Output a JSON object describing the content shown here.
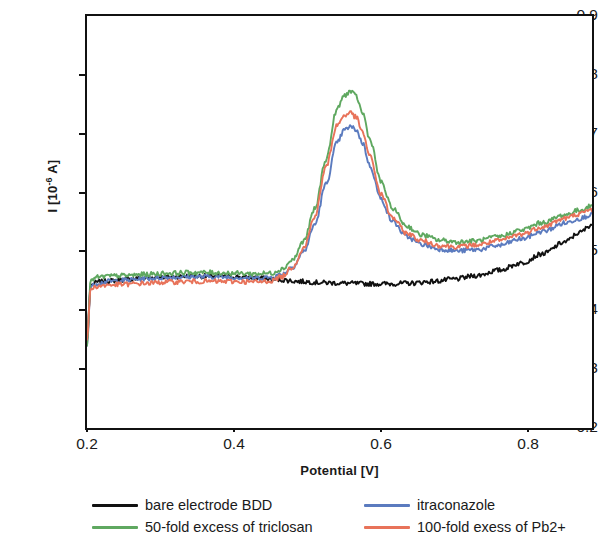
{
  "chart_data": {
    "type": "line",
    "title": "",
    "xlabel": "Potential [V]",
    "ylabel": "I [10-6 A]",
    "ylabel_prefix": "I [10",
    "ylabel_exponent": "-6",
    "ylabel_suffix": " A]",
    "xlim": [
      0.2,
      0.887
    ],
    "ylim": [
      0.2,
      0.9
    ],
    "xticks": [
      0.2,
      0.4,
      0.6,
      0.8
    ],
    "xtick_labels": [
      "0.2",
      "0.4",
      "0.6",
      "0.8"
    ],
    "yticks": [
      0.2,
      0.3,
      0.4,
      0.5,
      0.6,
      0.7,
      0.8,
      0.9
    ],
    "ytick_labels": [
      "0.2",
      "0.3",
      "0.4",
      "0.5",
      "0.6",
      "0.7",
      "0.8",
      "0.9"
    ],
    "grid": false,
    "legend_position": "below-plot",
    "noise_amplitude": 0.004,
    "series": [
      {
        "name": "bare electrode BDD",
        "color": "#111111",
        "x": [
          0.2,
          0.205,
          0.215,
          0.23,
          0.25,
          0.28,
          0.31,
          0.34,
          0.37,
          0.4,
          0.43,
          0.46,
          0.49,
          0.52,
          0.55,
          0.58,
          0.61,
          0.64,
          0.67,
          0.7,
          0.73,
          0.76,
          0.79,
          0.82,
          0.85,
          0.87,
          0.887
        ],
        "y": [
          0.35,
          0.443,
          0.448,
          0.45,
          0.452,
          0.455,
          0.457,
          0.458,
          0.458,
          0.457,
          0.455,
          0.452,
          0.449,
          0.447,
          0.446,
          0.445,
          0.445,
          0.446,
          0.449,
          0.453,
          0.459,
          0.468,
          0.48,
          0.496,
          0.516,
          0.532,
          0.546
        ]
      },
      {
        "name": "itraconazole",
        "color": "#5B7BBF",
        "x": [
          0.2,
          0.205,
          0.215,
          0.23,
          0.25,
          0.28,
          0.31,
          0.34,
          0.37,
          0.4,
          0.43,
          0.45,
          0.465,
          0.48,
          0.495,
          0.51,
          0.525,
          0.54,
          0.55,
          0.558,
          0.566,
          0.575,
          0.585,
          0.6,
          0.615,
          0.635,
          0.655,
          0.68,
          0.705,
          0.73,
          0.76,
          0.79,
          0.82,
          0.85,
          0.87,
          0.887
        ],
        "y": [
          0.34,
          0.44,
          0.446,
          0.449,
          0.451,
          0.454,
          0.456,
          0.457,
          0.457,
          0.456,
          0.455,
          0.456,
          0.461,
          0.474,
          0.5,
          0.546,
          0.614,
          0.684,
          0.706,
          0.712,
          0.707,
          0.684,
          0.645,
          0.589,
          0.552,
          0.525,
          0.512,
          0.504,
          0.501,
          0.503,
          0.51,
          0.521,
          0.534,
          0.548,
          0.556,
          0.563
        ]
      },
      {
        "name": "50-fold excess of triclosan",
        "color": "#5FA860",
        "x": [
          0.2,
          0.205,
          0.215,
          0.23,
          0.25,
          0.28,
          0.31,
          0.34,
          0.37,
          0.4,
          0.43,
          0.45,
          0.465,
          0.48,
          0.495,
          0.51,
          0.525,
          0.54,
          0.55,
          0.558,
          0.566,
          0.575,
          0.585,
          0.6,
          0.615,
          0.635,
          0.655,
          0.68,
          0.705,
          0.73,
          0.76,
          0.79,
          0.82,
          0.85,
          0.87,
          0.887
        ],
        "y": [
          0.34,
          0.452,
          0.456,
          0.458,
          0.459,
          0.461,
          0.463,
          0.464,
          0.464,
          0.463,
          0.462,
          0.463,
          0.47,
          0.486,
          0.518,
          0.572,
          0.656,
          0.741,
          0.765,
          0.772,
          0.764,
          0.735,
          0.69,
          0.618,
          0.574,
          0.543,
          0.528,
          0.519,
          0.516,
          0.518,
          0.525,
          0.536,
          0.549,
          0.562,
          0.57,
          0.577
        ]
      },
      {
        "name": "100-fold exess of Pb2+",
        "color": "#E8735A",
        "x": [
          0.2,
          0.205,
          0.215,
          0.23,
          0.25,
          0.28,
          0.31,
          0.34,
          0.37,
          0.4,
          0.43,
          0.45,
          0.465,
          0.48,
          0.495,
          0.51,
          0.525,
          0.54,
          0.55,
          0.558,
          0.566,
          0.575,
          0.585,
          0.6,
          0.615,
          0.635,
          0.655,
          0.68,
          0.705,
          0.73,
          0.76,
          0.79,
          0.82,
          0.85,
          0.87,
          0.887
        ],
        "y": [
          0.35,
          0.437,
          0.441,
          0.443,
          0.444,
          0.446,
          0.448,
          0.449,
          0.449,
          0.449,
          0.448,
          0.45,
          0.457,
          0.474,
          0.506,
          0.56,
          0.643,
          0.714,
          0.731,
          0.736,
          0.728,
          0.702,
          0.661,
          0.597,
          0.558,
          0.531,
          0.518,
          0.51,
          0.508,
          0.511,
          0.518,
          0.529,
          0.542,
          0.556,
          0.564,
          0.571
        ]
      }
    ]
  },
  "legend": {
    "items": [
      {
        "label": "bare electrode BDD",
        "color": "#111111"
      },
      {
        "label": "itraconazole",
        "color": "#5B7BBF"
      },
      {
        "label": "50-fold excess of triclosan",
        "color": "#5FA860"
      },
      {
        "label": "100-fold exess of Pb2+",
        "color": "#E8735A"
      }
    ]
  }
}
